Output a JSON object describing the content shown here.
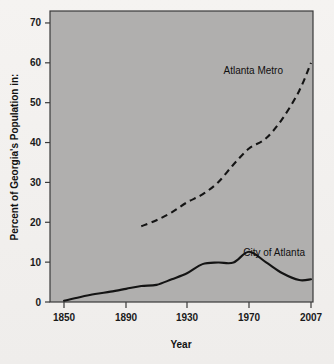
{
  "chart_data": {
    "type": "line",
    "title": "",
    "subtitle": "",
    "xlabel": "Year",
    "ylabel": "Percent of Georgia's Population in:",
    "xlim": [
      1850,
      2007
    ],
    "ylim": [
      0,
      73
    ],
    "grid": false,
    "legend_position": "inline-annotation",
    "plot_background_color": "#b0afae",
    "figure_background_color": "#f3f1ef",
    "line_color": "#141414",
    "xticks": [
      1850,
      1890,
      1930,
      1970,
      2007
    ],
    "xtick_labels": [
      "1850",
      "1890",
      "1930",
      "1970",
      "2007"
    ],
    "yticks": [
      0,
      10,
      20,
      30,
      40,
      50,
      60,
      70
    ],
    "ytick_labels": [
      "0",
      "10",
      "20",
      "30",
      "40",
      "50",
      "60",
      "70"
    ],
    "series": [
      {
        "name": "Atlanta Metro",
        "style": "dashed",
        "annotation": "Atlanta Metro",
        "x": [
          1900,
          1910,
          1920,
          1930,
          1940,
          1950,
          1960,
          1970,
          1980,
          1990,
          2000,
          2007
        ],
        "values": [
          19.0,
          20.5,
          22.5,
          25.0,
          27.0,
          30.0,
          34.5,
          38.5,
          41.0,
          46.0,
          53.0,
          60.0
        ]
      },
      {
        "name": "City of Atlanta",
        "style": "solid",
        "annotation": "City of Atlanta",
        "x": [
          1850,
          1860,
          1870,
          1880,
          1890,
          1900,
          1910,
          1920,
          1930,
          1940,
          1950,
          1960,
          1970,
          1980,
          1990,
          2000,
          2007
        ],
        "values": [
          0.3,
          1.2,
          2.0,
          2.6,
          3.3,
          4.0,
          4.3,
          5.7,
          7.2,
          9.5,
          9.9,
          9.9,
          12.6,
          10.0,
          7.2,
          5.5,
          5.7
        ]
      }
    ]
  },
  "axes": {
    "x_axis_title": "Year",
    "y_axis_title": "Percent of Georgia's Population in:"
  },
  "annotations": {
    "metro_label": "Atlanta Metro",
    "city_label": "City of Atlanta"
  }
}
